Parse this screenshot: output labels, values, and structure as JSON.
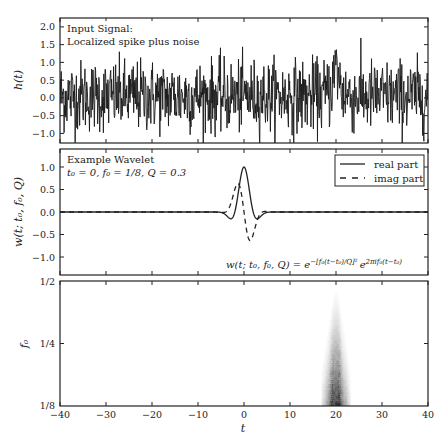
{
  "figure": {
    "width": 448,
    "height": 448,
    "background": "#ffffff",
    "ink": "#222222"
  },
  "chart_data": [
    {
      "type": "line",
      "panel": "input-signal",
      "title": "",
      "annotation": [
        "Input Signal:",
        "Localized spike plus noise"
      ],
      "xlabel": "",
      "ylabel": "h(t)",
      "xlim": [
        -40,
        40
      ],
      "ylim": [
        -1.27,
        2.25
      ],
      "yticks": [
        2.0,
        1.5,
        1.0,
        0.5,
        0.0,
        -0.5,
        -1.0
      ],
      "ytick_labels": [
        "2.0",
        "1.5",
        "1.0",
        "0.5",
        "0.0",
        "−0.5",
        "−1.0"
      ],
      "xticks": [
        -40,
        -30,
        -20,
        -10,
        0,
        10,
        20,
        30,
        40
      ],
      "grid": false,
      "series": [
        {
          "name": "h(t)",
          "description": "Gaussian noise (sigma ~0.5) plus localized oscillating spike centered at t=20",
          "noise_sigma": 0.5,
          "spike_center": 20,
          "spike_amplitude": 0.8,
          "spike_width": 1.5,
          "n_points": 900
        }
      ]
    },
    {
      "type": "line",
      "panel": "example-wavelet",
      "annotation": [
        "Example Wavelet",
        "t₀ = 0, f₀ = 1/8, Q = 0.3"
      ],
      "formula": "w(t; t₀, f₀, Q) = e^{−[f₀(t−t₀)/Q]²} e^{2πif₀(t−t₀)}",
      "xlabel": "",
      "ylabel": "w(t; t₀, f₀, Q)",
      "xlim": [
        -40,
        40
      ],
      "ylim": [
        -1.4,
        1.4
      ],
      "yticks": [
        1.0,
        0.5,
        0.0,
        -0.5,
        -1.0
      ],
      "ytick_labels": [
        "1.0",
        "0.5",
        "0.0",
        "−0.5",
        "−1.0"
      ],
      "xticks": [
        -40,
        -30,
        -20,
        -10,
        0,
        10,
        20,
        30,
        40
      ],
      "grid": false,
      "legend": {
        "position": "upper right",
        "entries": [
          {
            "label": "real part",
            "style": "solid"
          },
          {
            "label": "imag part",
            "style": "dashed"
          }
        ]
      },
      "params": {
        "t0": 0,
        "f0": 0.125,
        "Q": 0.3
      }
    },
    {
      "type": "heatmap",
      "panel": "wavelet-psd",
      "xlabel": "t",
      "ylabel": "f₀",
      "xlim": [
        -40,
        40
      ],
      "ylim_labels": [
        "1/8",
        "1/4",
        "1/2"
      ],
      "yscale": "log2",
      "xticks": [
        -40,
        -30,
        -20,
        -10,
        0,
        10,
        20,
        30,
        40
      ],
      "xtick_labels": [
        "−40",
        "−30",
        "−20",
        "−10",
        "0",
        "10",
        "20",
        "30",
        "40"
      ],
      "colormap": "gray_r",
      "feature": {
        "center_t": 20,
        "width_at_f_min": 2.2,
        "width_at_f_max": 0.4,
        "intensity_max_at": "1/8"
      }
    }
  ],
  "labels": {
    "p1_line1": "Input Signal:",
    "p1_line2": "Localized spike plus noise",
    "p1_ylabel": "h(t)",
    "p2_line1": "Example Wavelet",
    "p2_line2": "t₀ = 0, f₀ = 1/8, Q = 0.3",
    "p2_ylabel": "w(t; t₀, f₀, Q)",
    "p2_formula_lhs": "w(t; t₀, f₀, Q) = e",
    "p2_formula_exp1": "−[f₀(t−t₀)/Q]²",
    "p2_formula_mid": "e",
    "p2_formula_exp2": "2πif₀(t−t₀)",
    "legend_real": "real part",
    "legend_imag": "imag part",
    "p3_ylabel": "f₀",
    "p3_xlabel": "t",
    "p3_ytick_top": "1/2",
    "p3_ytick_mid": "1/4",
    "p3_ytick_bot": "1/8",
    "p1_yt": [
      "2.0",
      "1.5",
      "1.0",
      "0.5",
      "0.0",
      "−0.5",
      "−1.0"
    ],
    "p2_yt": [
      "1.0",
      "0.5",
      "0.0",
      "−0.5",
      "−1.0"
    ],
    "xt": [
      "−40",
      "−30",
      "−20",
      "−10",
      "0",
      "10",
      "20",
      "30",
      "40"
    ]
  }
}
